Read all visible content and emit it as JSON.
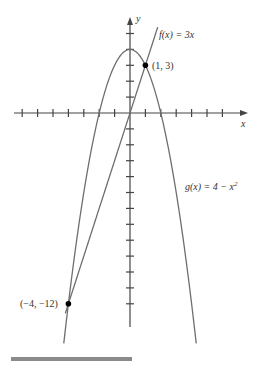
{
  "chart_data": {
    "type": "line",
    "title": "",
    "xlabel": "x",
    "ylabel": "y",
    "xlim": [
      -7.5,
      7.5
    ],
    "ylim": [
      -13.5,
      6
    ],
    "grid": false,
    "x_ticks": [
      -7,
      -6,
      -5,
      -4,
      -3,
      -2,
      -1,
      1,
      2,
      3,
      4,
      5,
      6
    ],
    "y_ticks": [
      -12,
      -11,
      -10,
      -9,
      -8,
      -7,
      -6,
      -5,
      -4,
      -3,
      -2,
      -1,
      1,
      2,
      3,
      4,
      5
    ],
    "series": [
      {
        "name": "f(x) = 3x",
        "expression": "3x",
        "x_range": [
          -4.2,
          1.8
        ],
        "color": "#6e6e6e"
      },
      {
        "name": "g(x) = 4 − x²",
        "expression": "4 - x^2",
        "x_range": [
          -4.3,
          4.3
        ],
        "color": "#6e6e6e"
      }
    ],
    "points": [
      {
        "x": 1,
        "y": 3,
        "label": "(1, 3)"
      },
      {
        "x": -4,
        "y": -12,
        "label": "(−4, −12)"
      }
    ],
    "annotations": [
      "f(x) = 3x",
      "g(x) = 4 − x²"
    ]
  },
  "labels": {
    "f": "f(x) = 3x",
    "g_prefix": "g(x) = 4 − x",
    "g_sup": "2",
    "p1": "(1, 3)",
    "p2": "(−4, −12)",
    "x_axis": "x",
    "y_axis": "y"
  }
}
